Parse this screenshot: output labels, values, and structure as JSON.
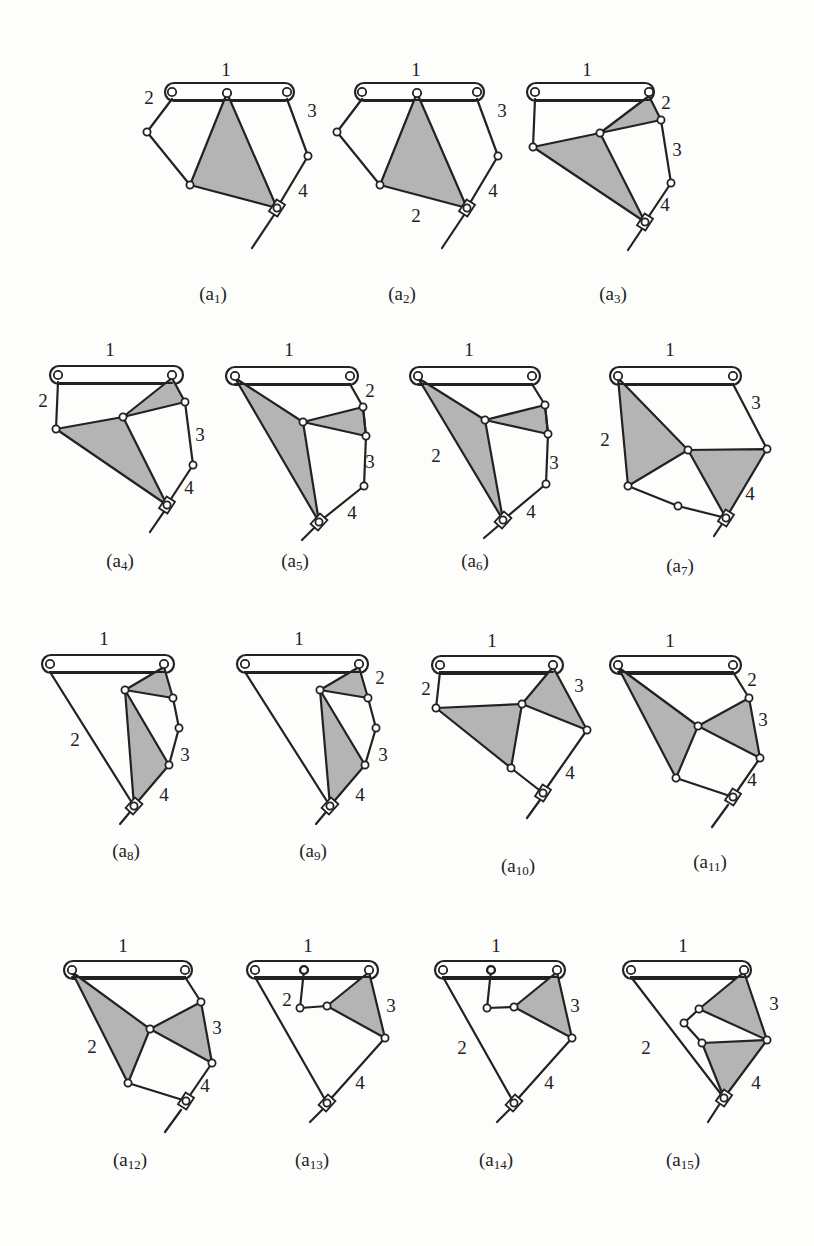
{
  "figure": {
    "type": "kinematic-chain-configurations",
    "panels": [
      {
        "id": "a1",
        "caption_base": "(a",
        "caption_sub": "1",
        "caption_end": ")",
        "labels": [
          "1",
          "2",
          "3",
          "4"
        ]
      },
      {
        "id": "a2",
        "caption_base": "(a",
        "caption_sub": "2",
        "caption_end": ")",
        "labels": [
          "1",
          "2",
          "3",
          "4"
        ]
      },
      {
        "id": "a3",
        "caption_base": "(a",
        "caption_sub": "3",
        "caption_end": ")",
        "labels": [
          "1",
          "2",
          "3",
          "4"
        ]
      },
      {
        "id": "a4",
        "caption_base": "(a",
        "caption_sub": "4",
        "caption_end": ")",
        "labels": [
          "1",
          "2",
          "3",
          "4"
        ]
      },
      {
        "id": "a5",
        "caption_base": "(a",
        "caption_sub": "5",
        "caption_end": ")",
        "labels": [
          "1",
          "2",
          "3",
          "4"
        ]
      },
      {
        "id": "a6",
        "caption_base": "(a",
        "caption_sub": "6",
        "caption_end": ")",
        "labels": [
          "1",
          "2",
          "3",
          "4"
        ]
      },
      {
        "id": "a7",
        "caption_base": "(a",
        "caption_sub": "7",
        "caption_end": ")",
        "labels": [
          "1",
          "2",
          "3",
          "4"
        ]
      },
      {
        "id": "a8",
        "caption_base": "(a",
        "caption_sub": "8",
        "caption_end": ")",
        "labels": [
          "1",
          "2",
          "3",
          "4"
        ]
      },
      {
        "id": "a9",
        "caption_base": "(a",
        "caption_sub": "9",
        "caption_end": ")",
        "labels": [
          "1",
          "2",
          "3",
          "4"
        ]
      },
      {
        "id": "a10",
        "caption_base": "(a",
        "caption_sub": "10",
        "caption_end": ")",
        "labels": [
          "1",
          "2",
          "3",
          "4"
        ]
      },
      {
        "id": "a11",
        "caption_base": "(a",
        "caption_sub": "11",
        "caption_end": ")",
        "labels": [
          "1",
          "2",
          "3",
          "4"
        ]
      },
      {
        "id": "a12",
        "caption_base": "(a",
        "caption_sub": "12",
        "caption_end": ")",
        "labels": [
          "1",
          "2",
          "3",
          "4"
        ]
      },
      {
        "id": "a13",
        "caption_base": "(a",
        "caption_sub": "13",
        "caption_end": ")",
        "labels": [
          "1",
          "2",
          "3",
          "4"
        ]
      },
      {
        "id": "a14",
        "caption_base": "(a",
        "caption_sub": "14",
        "caption_end": ")",
        "labels": [
          "1",
          "2",
          "3",
          "4"
        ]
      },
      {
        "id": "a15",
        "caption_base": "(a",
        "caption_sub": "15",
        "caption_end": ")",
        "labels": [
          "1",
          "2",
          "3",
          "4"
        ]
      }
    ],
    "colors": {
      "line": "#222222",
      "shaded_link": "#b4b4b4",
      "background": "#fdfdfc"
    }
  }
}
